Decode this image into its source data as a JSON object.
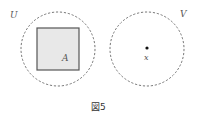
{
  "figure": {
    "caption": "図5",
    "sets": [
      {
        "name": "U",
        "label": "U",
        "cx": 58,
        "cy": 49,
        "r": 37
      },
      {
        "name": "V",
        "label": "V",
        "cx": 147,
        "cy": 49,
        "r": 37
      }
    ],
    "square": {
      "label": "A",
      "x": 37,
      "y": 28,
      "w": 42,
      "h": 42,
      "fill": "#e8e8e8",
      "stroke": "#555555"
    },
    "point": {
      "label": "x",
      "cx": 147,
      "cy": 48
    },
    "colors": {
      "circle_stroke": "#777777",
      "point": "#111111"
    }
  }
}
